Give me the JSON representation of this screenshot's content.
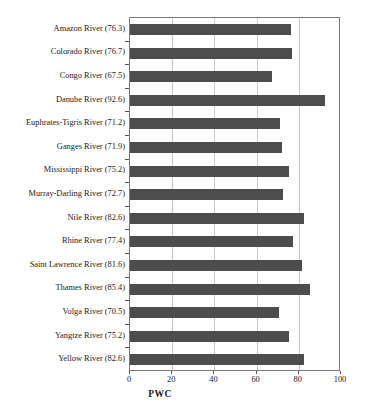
{
  "chart_data": {
    "type": "bar",
    "orientation": "horizontal",
    "title": "",
    "xlabel": "PWC",
    "ylabel": "",
    "xlim": [
      0,
      100
    ],
    "xticks": [
      0,
      20,
      40,
      60,
      80,
      100
    ],
    "xtick_labels": [
      "0",
      "20",
      "40",
      "60",
      "80",
      "100"
    ],
    "grid": "vertical",
    "legend": "none",
    "bar_color": "#4d4d4d",
    "categories": [
      "Amazon River (76.3)",
      "Colorado River (76.7)",
      "Congo River (67.5)",
      "Danube River (92.6)",
      "Euphrates-Tigris River (71.2)",
      "Ganges River (71.9)",
      "Mississippi River (75.2)",
      "Murray-Darling River (72.7)",
      "Nile River (82.6)",
      "Rhine River (77.4)",
      "Saint Lawrence River (81.6)",
      "Thames River (85.4)",
      "Volga River (70.5)",
      "Yangtze River (75.2)",
      "Yellow River (82.6)"
    ],
    "values": [
      76.3,
      76.7,
      67.5,
      92.6,
      71.2,
      71.9,
      75.2,
      72.7,
      82.6,
      77.4,
      81.6,
      85.4,
      70.5,
      75.2,
      82.6
    ]
  },
  "axis": {
    "x_title": "PWC"
  }
}
